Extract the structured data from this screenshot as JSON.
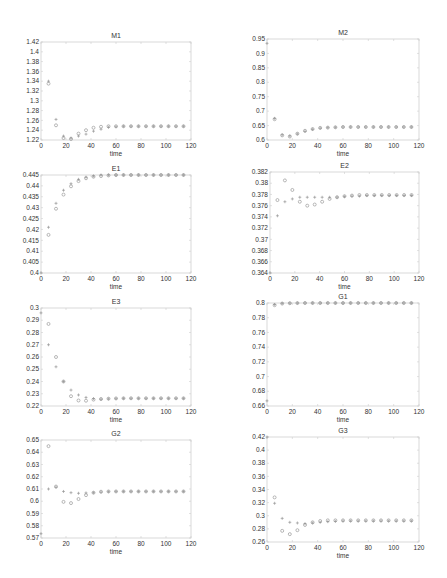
{
  "chart_data": [
    {
      "type": "scatter",
      "title": "M1",
      "xlabel": "time",
      "ylabel": "",
      "xlim": [
        0,
        120
      ],
      "ylim": [
        1.22,
        1.42
      ],
      "xticks": [
        0,
        20,
        40,
        60,
        80,
        100,
        120
      ],
      "yticks": [
        1.22,
        1.24,
        1.26,
        1.28,
        1.3,
        1.32,
        1.34,
        1.36,
        1.38,
        1.4,
        1.42
      ],
      "ytick_labels": [
        "1.22",
        "1.24",
        "1.26",
        "1.28",
        "1.3",
        "1.32",
        "1.34",
        "1.36",
        "1.38",
        "1.4",
        "1.42"
      ],
      "grid": false,
      "series": [
        {
          "name": "plus",
          "marker": "+",
          "x": [
            6,
            12,
            18,
            24,
            30,
            36,
            42,
            48,
            54,
            60,
            66,
            72,
            78,
            84,
            90,
            96,
            102,
            108,
            114
          ],
          "y": [
            1.34,
            1.262,
            1.228,
            1.224,
            1.228,
            1.232,
            1.238,
            1.242,
            1.246,
            1.247,
            1.248,
            1.248,
            1.248,
            1.248,
            1.248,
            1.248,
            1.248,
            1.248,
            1.248
          ]
        },
        {
          "name": "circle",
          "marker": "o",
          "x": [
            6,
            12,
            18,
            24,
            30,
            36,
            42,
            48,
            54,
            60,
            66,
            72,
            78,
            84,
            90,
            96,
            102,
            108,
            114
          ],
          "y": [
            1.335,
            1.25,
            1.224,
            1.222,
            1.233,
            1.24,
            1.245,
            1.247,
            1.248,
            1.248,
            1.248,
            1.248,
            1.248,
            1.248,
            1.248,
            1.248,
            1.248,
            1.248,
            1.248
          ]
        }
      ]
    },
    {
      "type": "scatter",
      "title": "M2",
      "xlabel": "time",
      "ylabel": "",
      "xlim": [
        0,
        120
      ],
      "ylim": [
        0.6,
        0.95
      ],
      "xticks": [
        0,
        20,
        40,
        60,
        80,
        100,
        120
      ],
      "yticks": [
        0.6,
        0.65,
        0.7,
        0.75,
        0.8,
        0.85,
        0.9,
        0.95
      ],
      "ytick_labels": [
        "0.6",
        "0.65",
        "0.7",
        "0.75",
        "0.8",
        "0.85",
        "0.9",
        "0.95"
      ],
      "grid": false,
      "series": [
        {
          "name": "plus",
          "marker": "+",
          "x": [
            0,
            6,
            12,
            18,
            24,
            30,
            36,
            42,
            48,
            54,
            60,
            66,
            72,
            78,
            84,
            90,
            96,
            102,
            108,
            114
          ],
          "y": [
            0.935,
            0.675,
            0.618,
            0.614,
            0.621,
            0.63,
            0.637,
            0.641,
            0.643,
            0.644,
            0.645,
            0.645,
            0.645,
            0.645,
            0.645,
            0.645,
            0.645,
            0.645,
            0.645,
            0.645
          ]
        },
        {
          "name": "circle",
          "marker": "o",
          "x": [
            6,
            12,
            18,
            24,
            30,
            36,
            42,
            48,
            54,
            60,
            66,
            72,
            78,
            84,
            90,
            96,
            102,
            108,
            114
          ],
          "y": [
            0.672,
            0.616,
            0.612,
            0.622,
            0.632,
            0.638,
            0.642,
            0.643,
            0.644,
            0.645,
            0.645,
            0.645,
            0.645,
            0.645,
            0.645,
            0.645,
            0.645,
            0.645,
            0.645
          ]
        }
      ]
    },
    {
      "type": "scatter",
      "title": "E1",
      "xlabel": "time",
      "ylabel": "",
      "xlim": [
        0,
        120
      ],
      "ylim": [
        0.4,
        0.445
      ],
      "xticks": [
        0,
        20,
        40,
        60,
        80,
        100,
        120
      ],
      "yticks": [
        0.4,
        0.405,
        0.41,
        0.415,
        0.42,
        0.425,
        0.43,
        0.435,
        0.44,
        0.445
      ],
      "ytick_labels": [
        "0.4",
        "0.405",
        "0.41",
        "0.415",
        "0.42",
        "0.425",
        "0.43",
        "0.435",
        "0.44",
        "0.445"
      ],
      "grid": false,
      "series": [
        {
          "name": "plus",
          "marker": "+",
          "x": [
            0,
            6,
            12,
            18,
            24,
            30,
            36,
            42,
            48,
            54,
            60,
            66,
            72,
            78,
            84,
            90,
            96,
            102,
            108,
            114
          ],
          "y": [
            0.4,
            0.421,
            0.432,
            0.438,
            0.441,
            0.443,
            0.444,
            0.4445,
            0.445,
            0.445,
            0.445,
            0.445,
            0.445,
            0.445,
            0.445,
            0.445,
            0.445,
            0.445,
            0.445,
            0.445
          ]
        },
        {
          "name": "circle",
          "marker": "o",
          "x": [
            6,
            12,
            18,
            24,
            30,
            36,
            42,
            48,
            54,
            60,
            66,
            72,
            78,
            84,
            90,
            96,
            102,
            108,
            114
          ],
          "y": [
            0.4175,
            0.4295,
            0.436,
            0.4398,
            0.4422,
            0.4435,
            0.4442,
            0.4445,
            0.4448,
            0.445,
            0.445,
            0.445,
            0.445,
            0.445,
            0.445,
            0.445,
            0.445,
            0.445,
            0.445
          ]
        }
      ]
    },
    {
      "type": "scatter",
      "title": "E2",
      "xlabel": "time",
      "ylabel": "",
      "xlim": [
        0,
        120
      ],
      "ylim": [
        0.364,
        0.382
      ],
      "xticks": [
        0,
        20,
        40,
        60,
        80,
        100,
        120
      ],
      "yticks": [
        0.364,
        0.366,
        0.368,
        0.37,
        0.372,
        0.374,
        0.376,
        0.378,
        0.38,
        0.382
      ],
      "ytick_labels": [
        "0.364",
        "0.366",
        "0.368",
        "0.37",
        "0.372",
        "0.374",
        "0.376",
        "0.378",
        "0.38",
        "0.382"
      ],
      "grid": false,
      "series": [
        {
          "name": "plus",
          "marker": "+",
          "x": [
            0,
            6,
            12,
            18,
            24,
            30,
            36,
            42,
            48,
            54,
            60,
            66,
            72,
            78,
            84,
            90,
            96,
            102,
            108,
            114
          ],
          "y": [
            0.364,
            0.3742,
            0.3767,
            0.3772,
            0.3775,
            0.3775,
            0.3775,
            0.3775,
            0.3775,
            0.3775,
            0.3776,
            0.3777,
            0.3777,
            0.3778,
            0.3778,
            0.3778,
            0.3778,
            0.3778,
            0.3778,
            0.3778
          ]
        },
        {
          "name": "circle",
          "marker": "o",
          "x": [
            6,
            12,
            18,
            24,
            30,
            36,
            42,
            48,
            54,
            60,
            66,
            72,
            78,
            84,
            90,
            96,
            102,
            108,
            114
          ],
          "y": [
            0.377,
            0.3805,
            0.3788,
            0.3767,
            0.376,
            0.3762,
            0.3767,
            0.3772,
            0.3775,
            0.3777,
            0.3778,
            0.3779,
            0.3779,
            0.3779,
            0.3779,
            0.3779,
            0.3779,
            0.3779,
            0.3779
          ]
        }
      ]
    },
    {
      "type": "scatter",
      "title": "E3",
      "xlabel": "time",
      "ylabel": "",
      "xlim": [
        0,
        120
      ],
      "ylim": [
        0.22,
        0.3
      ],
      "xticks": [
        0,
        20,
        40,
        60,
        80,
        100,
        120
      ],
      "yticks": [
        0.22,
        0.23,
        0.24,
        0.25,
        0.26,
        0.27,
        0.28,
        0.29,
        0.3
      ],
      "ytick_labels": [
        "0.22",
        "0.23",
        "0.24",
        "0.25",
        "0.26",
        "0.27",
        "0.28",
        "0.29",
        "0.3"
      ],
      "grid": false,
      "series": [
        {
          "name": "plus",
          "marker": "+",
          "x": [
            0,
            6,
            12,
            18,
            24,
            30,
            36,
            42,
            48,
            54,
            60,
            66,
            72,
            78,
            84,
            90,
            96,
            102,
            108,
            114
          ],
          "y": [
            0.296,
            0.27,
            0.252,
            0.24,
            0.233,
            0.229,
            0.227,
            0.226,
            0.2255,
            0.2258,
            0.226,
            0.2262,
            0.2262,
            0.2262,
            0.2262,
            0.2262,
            0.2262,
            0.2262,
            0.2262,
            0.2262
          ]
        },
        {
          "name": "circle",
          "marker": "o",
          "x": [
            6,
            12,
            18,
            24,
            30,
            36,
            42,
            48,
            54,
            60,
            66,
            72,
            78,
            84,
            90,
            96,
            102,
            108,
            114
          ],
          "y": [
            0.287,
            0.26,
            0.24,
            0.228,
            0.2245,
            0.2243,
            0.2252,
            0.2257,
            0.226,
            0.2262,
            0.2263,
            0.2263,
            0.2263,
            0.2263,
            0.2263,
            0.2263,
            0.2263,
            0.2263,
            0.2263
          ]
        }
      ]
    },
    {
      "type": "scatter",
      "title": "G1",
      "xlabel": "time",
      "ylabel": "",
      "xlim": [
        0,
        120
      ],
      "ylim": [
        0.66,
        0.8
      ],
      "xticks": [
        0,
        20,
        40,
        60,
        80,
        100,
        120
      ],
      "yticks": [
        0.66,
        0.68,
        0.7,
        0.72,
        0.74,
        0.76,
        0.78,
        0.8
      ],
      "ytick_labels": [
        "0.66",
        "0.68",
        "0.7",
        "0.72",
        "0.74",
        "0.76",
        "0.78",
        "0.8"
      ],
      "grid": false,
      "series": [
        {
          "name": "plus",
          "marker": "+",
          "x": [
            0,
            6,
            12,
            18,
            24,
            30,
            36,
            42,
            48,
            54,
            60,
            66,
            72,
            78,
            84,
            90,
            96,
            102,
            108,
            114
          ],
          "y": [
            0.667,
            0.798,
            0.7995,
            0.7998,
            0.7999,
            0.8,
            0.8,
            0.8,
            0.8,
            0.8,
            0.8,
            0.8,
            0.8,
            0.8,
            0.8,
            0.8,
            0.8,
            0.8,
            0.8,
            0.8
          ]
        },
        {
          "name": "circle",
          "marker": "o",
          "x": [
            6,
            12,
            18,
            24,
            30,
            36,
            42,
            48,
            54,
            60,
            66,
            72,
            78,
            84,
            90,
            96,
            102,
            108,
            114
          ],
          "y": [
            0.797,
            0.7992,
            0.7997,
            0.7999,
            0.8,
            0.8,
            0.8,
            0.8,
            0.8,
            0.8,
            0.8,
            0.8,
            0.8,
            0.8,
            0.8,
            0.8,
            0.8,
            0.8,
            0.8
          ]
        }
      ]
    },
    {
      "type": "scatter",
      "title": "G2",
      "xlabel": "time",
      "ylabel": "",
      "xlim": [
        0,
        120
      ],
      "ylim": [
        0.57,
        0.65
      ],
      "xticks": [
        0,
        20,
        40,
        60,
        80,
        100,
        120
      ],
      "yticks": [
        0.57,
        0.58,
        0.59,
        0.6,
        0.61,
        0.62,
        0.63,
        0.64,
        0.65
      ],
      "ytick_labels": [
        "0.57",
        "0.58",
        "0.59",
        "0.6",
        "0.61",
        "0.62",
        "0.63",
        "0.64",
        "0.65"
      ],
      "grid": false,
      "series": [
        {
          "name": "plus",
          "marker": "+",
          "x": [
            0,
            6,
            12,
            18,
            24,
            30,
            36,
            42,
            48,
            54,
            60,
            66,
            72,
            78,
            84,
            90,
            96,
            102,
            108,
            114
          ],
          "y": [
            0.5735,
            0.61,
            0.6115,
            0.608,
            0.607,
            0.6065,
            0.6068,
            0.607,
            0.6075,
            0.6078,
            0.608,
            0.608,
            0.608,
            0.608,
            0.608,
            0.608,
            0.608,
            0.608,
            0.608,
            0.608
          ]
        },
        {
          "name": "circle",
          "marker": "o",
          "x": [
            6,
            12,
            18,
            24,
            30,
            36,
            42,
            48,
            54,
            60,
            66,
            72,
            78,
            84,
            90,
            96,
            102,
            108,
            114
          ],
          "y": [
            0.645,
            0.612,
            0.5995,
            0.5985,
            0.6018,
            0.605,
            0.607,
            0.6078,
            0.608,
            0.608,
            0.608,
            0.608,
            0.608,
            0.608,
            0.608,
            0.608,
            0.608,
            0.608,
            0.608
          ]
        }
      ]
    },
    {
      "type": "scatter",
      "title": "G3",
      "xlabel": "time",
      "ylabel": "",
      "xlim": [
        0,
        120
      ],
      "ylim": [
        0.26,
        0.42
      ],
      "xticks": [
        0,
        20,
        40,
        60,
        80,
        100,
        120
      ],
      "yticks": [
        0.26,
        0.28,
        0.3,
        0.32,
        0.34,
        0.36,
        0.38,
        0.4,
        0.42
      ],
      "ytick_labels": [
        "0.26",
        "0.28",
        "0.3",
        "0.32",
        "0.34",
        "0.36",
        "0.38",
        "0.4",
        "0.42"
      ],
      "grid": false,
      "series": [
        {
          "name": "plus",
          "marker": "+",
          "x": [
            0,
            6,
            12,
            18,
            24,
            30,
            36,
            42,
            48,
            54,
            60,
            66,
            72,
            78,
            84,
            90,
            96,
            102,
            108,
            114
          ],
          "y": [
            0.42,
            0.319,
            0.296,
            0.29,
            0.289,
            0.288,
            0.289,
            0.29,
            0.291,
            0.2915,
            0.292,
            0.292,
            0.292,
            0.292,
            0.292,
            0.292,
            0.292,
            0.292,
            0.292,
            0.292
          ]
        },
        {
          "name": "circle",
          "marker": "o",
          "x": [
            6,
            12,
            18,
            24,
            30,
            36,
            42,
            48,
            54,
            60,
            66,
            72,
            78,
            84,
            90,
            96,
            102,
            108,
            114
          ],
          "y": [
            0.328,
            0.277,
            0.272,
            0.278,
            0.286,
            0.29,
            0.292,
            0.293,
            0.293,
            0.293,
            0.293,
            0.293,
            0.293,
            0.293,
            0.293,
            0.293,
            0.293,
            0.293,
            0.293
          ]
        }
      ]
    }
  ],
  "style": {
    "marker_color": "#8a8a8a",
    "axis_color": "#cfcfcf",
    "text_color": "#333333"
  },
  "layout": [
    {
      "left": 41,
      "top": 42,
      "width": 150,
      "height": 98
    },
    {
      "left": 267,
      "top": 39,
      "width": 152,
      "height": 101
    },
    {
      "left": 41,
      "top": 175,
      "width": 150,
      "height": 98
    },
    {
      "left": 270,
      "top": 172,
      "width": 149,
      "height": 101
    },
    {
      "left": 41,
      "top": 308,
      "width": 150,
      "height": 98
    },
    {
      "left": 267,
      "top": 303,
      "width": 152,
      "height": 103
    },
    {
      "left": 41,
      "top": 440,
      "width": 150,
      "height": 98
    },
    {
      "left": 267,
      "top": 437,
      "width": 152,
      "height": 105
    }
  ]
}
